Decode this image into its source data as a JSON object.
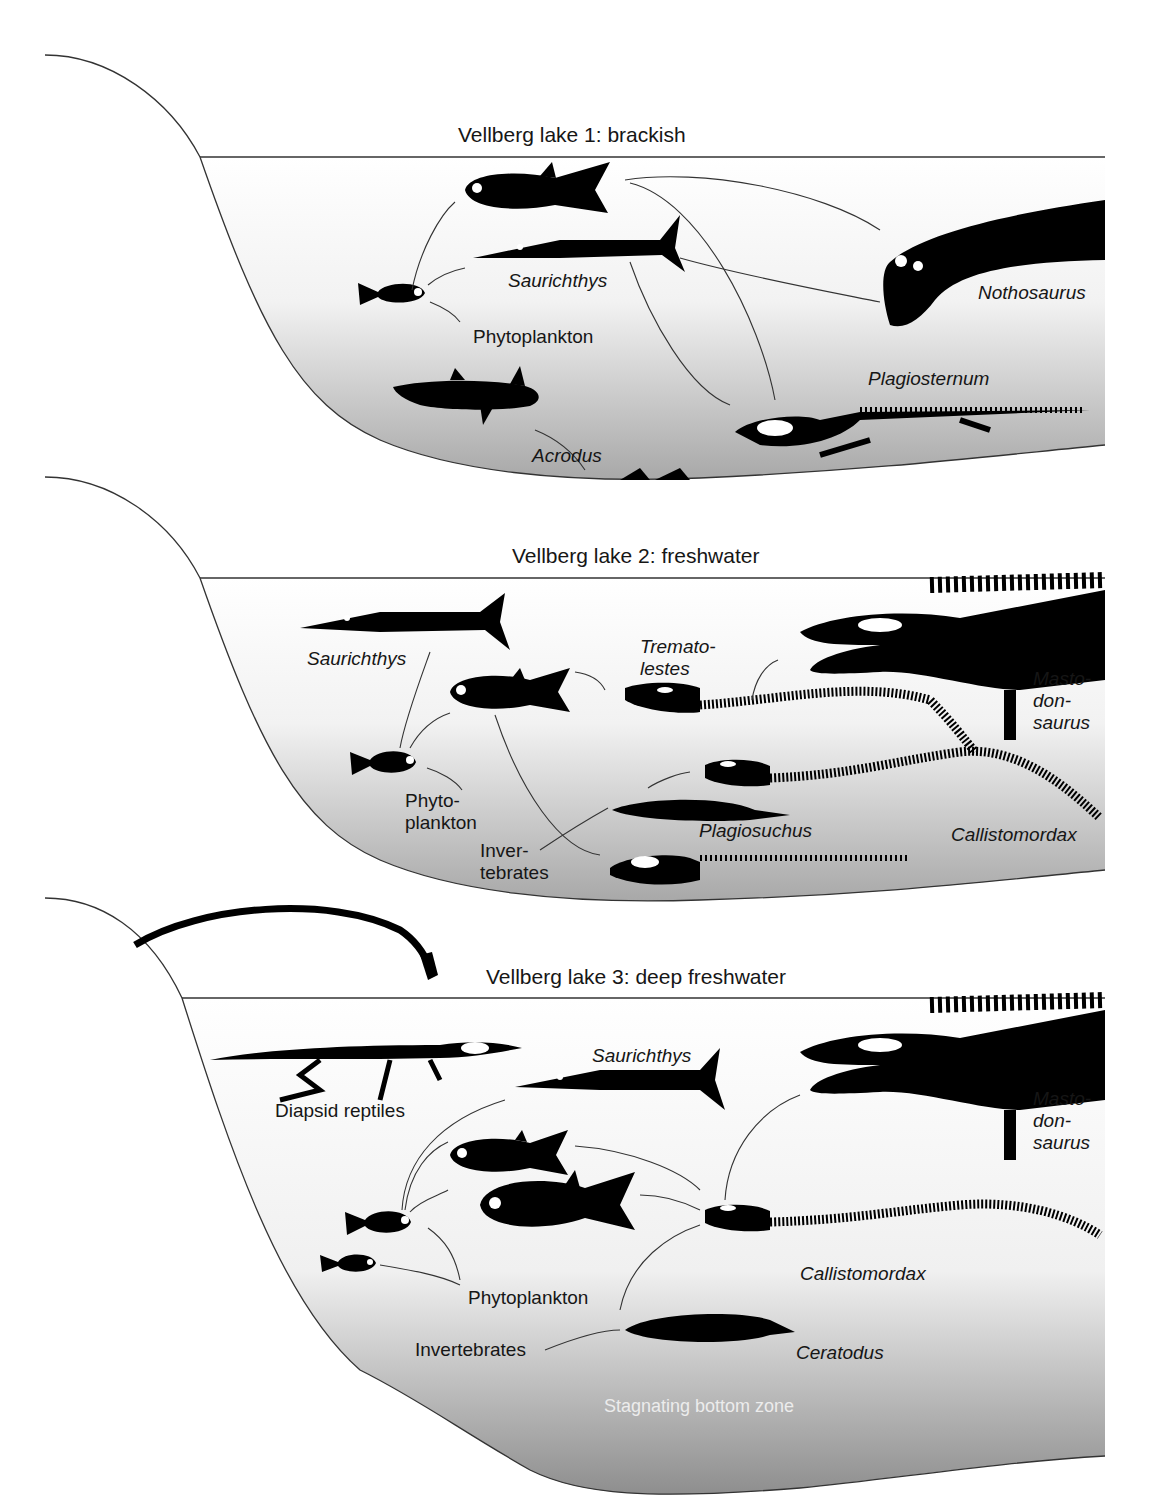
{
  "figure": {
    "panels": [
      {
        "title": "Vellberg lake 1: brackish",
        "labels": {
          "saurichthys": "Saurichthys",
          "phytoplankton": "Phytoplankton",
          "nothosaurus": "Nothosaurus",
          "plagiosternum": "Plagiosternum",
          "acrodus": "Acrodus"
        }
      },
      {
        "title": "Vellberg lake 2: freshwater",
        "labels": {
          "saurichthys": "Saurichthys",
          "trematolestes_1": "Tremato-",
          "trematolestes_2": "lestes",
          "mastodonsaurus_1": "Masto-",
          "mastodonsaurus_2": "don-",
          "mastodonsaurus_3": "saurus",
          "phytoplankton_1": "Phyto-",
          "phytoplankton_2": "plankton",
          "invertebrates_1": "Inver-",
          "invertebrates_2": "tebrates",
          "plagiosuchus": "Plagiosuchus",
          "callistomordax": "Callistomordax"
        }
      },
      {
        "title": "Vellberg lake 3: deep freshwater",
        "labels": {
          "diapsid": "Diapsid reptiles",
          "saurichthys": "Saurichthys",
          "mastodonsaurus_1": "Masto-",
          "mastodonsaurus_2": "don-",
          "mastodonsaurus_3": "saurus",
          "phytoplankton": "Phytoplankton",
          "invertebrates": "Invertebrates",
          "callistomordax": "Callistomordax",
          "ceratodus": "Ceratodus",
          "bottom_zone": "Stagnating bottom zone"
        }
      }
    ],
    "colors": {
      "water_top": "#ffffff",
      "water_bottom": "#9a9a9a",
      "silhouette": "#000000",
      "line": "#333333"
    }
  }
}
